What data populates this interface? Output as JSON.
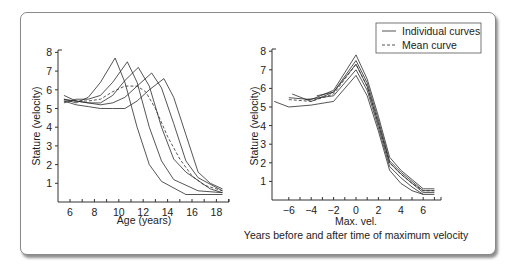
{
  "chart_data": [
    {
      "type": "line",
      "title": "",
      "xlabel": "Age (years)",
      "ylabel": "Stature (velocity)",
      "xlim": [
        5.3,
        19
      ],
      "ylim": [
        0,
        8
      ],
      "xticks": [
        6,
        8,
        10,
        12,
        14,
        16,
        18
      ],
      "xminor_ticks": [
        6,
        7,
        8,
        9,
        10,
        11,
        12,
        13,
        14,
        15,
        16,
        17,
        18,
        19
      ],
      "yticks": [
        1,
        2,
        3,
        4,
        5,
        6,
        7,
        8
      ],
      "grid": false,
      "series": [
        {
          "name": "Individual curve 1",
          "style": "solid",
          "x": [
            5.5,
            6.5,
            7.5,
            8.5,
            9.7,
            10.5,
            11.5,
            12.5,
            13.5,
            15.5,
            18.5
          ],
          "y": [
            5.5,
            5.3,
            5.6,
            6.4,
            7.7,
            6.4,
            4.0,
            2.0,
            1.1,
            0.4,
            0.4
          ]
        },
        {
          "name": "Individual curve 2",
          "style": "solid",
          "x": [
            5.5,
            6.5,
            7.5,
            8.5,
            9.5,
            10.7,
            11.5,
            12.5,
            13.5,
            14.5,
            16.5,
            18.5
          ],
          "y": [
            5.3,
            5.5,
            5.5,
            5.7,
            6.4,
            7.5,
            6.4,
            4.0,
            2.2,
            1.2,
            0.6,
            0.5
          ]
        },
        {
          "name": "Individual curve 3",
          "style": "solid",
          "x": [
            5.5,
            6.5,
            7.5,
            8.5,
            9.5,
            10.5,
            11.6,
            12.5,
            13.5,
            14.5,
            15.5,
            17.5,
            18.5
          ],
          "y": [
            5.5,
            5.4,
            5.3,
            5.3,
            5.7,
            6.5,
            7.2,
            6.2,
            4.0,
            2.3,
            1.6,
            0.7,
            0.5
          ]
        },
        {
          "name": "Individual curve 4",
          "style": "solid",
          "x": [
            5.5,
            6.5,
            7.5,
            8.5,
            9.5,
            10.5,
            11.5,
            12.7,
            13.5,
            14.5,
            15.5,
            16.5,
            18.5
          ],
          "y": [
            5.7,
            5.4,
            5.3,
            5.2,
            5.3,
            5.6,
            6.2,
            6.9,
            6.1,
            4.2,
            2.2,
            1.3,
            0.6
          ]
        },
        {
          "name": "Individual curve 5",
          "style": "solid",
          "x": [
            5.5,
            6.5,
            7.5,
            8.5,
            9.5,
            10.5,
            11.5,
            12.5,
            13.7,
            14.5,
            15.5,
            16.5,
            17.5,
            18.5
          ],
          "y": [
            5.4,
            5.2,
            5.1,
            5.0,
            5.0,
            5.0,
            5.4,
            6.0,
            6.6,
            5.6,
            3.6,
            1.6,
            1.0,
            0.7
          ]
        },
        {
          "name": "Mean curve",
          "style": "dashed",
          "x": [
            5.5,
            6.5,
            7.5,
            8.5,
            9.5,
            10.5,
            11.5,
            12.2,
            13.0,
            14.0,
            15.0,
            16.0,
            17.0,
            18.5
          ],
          "y": [
            5.4,
            5.4,
            5.4,
            5.5,
            5.9,
            6.2,
            6.2,
            5.9,
            5.0,
            3.5,
            2.3,
            1.4,
            0.9,
            0.6
          ]
        }
      ]
    },
    {
      "type": "line",
      "title": "",
      "xlabel": "Max. vel.",
      "xlabel2": "Years before and after time of maximum velocity",
      "ylabel": "Stature (velocity)",
      "xlim": [
        -7.4,
        7.6
      ],
      "ylim": [
        0,
        8
      ],
      "xticks": [
        -6,
        -4,
        -2,
        0,
        2,
        4,
        6
      ],
      "xtick_labels": [
        "−6",
        "−4",
        "−2",
        "0",
        "2",
        "4",
        "6"
      ],
      "xminor_ticks": [
        -6,
        -5,
        -4,
        -3,
        -2,
        -1,
        0,
        1,
        2,
        3,
        4,
        5,
        6,
        7
      ],
      "yticks": [
        1,
        2,
        3,
        4,
        5,
        6,
        7,
        8
      ],
      "grid": false,
      "legend": {
        "position": "upper right",
        "entries": [
          {
            "label": "Individual curves",
            "style": "solid"
          },
          {
            "label": "Mean curve",
            "style": "dashed"
          }
        ]
      },
      "series": [
        {
          "name": "Individual curve 1",
          "style": "solid",
          "x": [
            -6,
            -4,
            -2,
            0,
            1,
            2,
            3,
            4,
            5,
            6,
            7
          ],
          "y": [
            5.5,
            5.4,
            5.9,
            7.8,
            6.5,
            4.5,
            2.3,
            1.6,
            1.1,
            0.6,
            0.6
          ]
        },
        {
          "name": "Individual curve 2",
          "style": "solid",
          "x": [
            -5.7,
            -4,
            -2,
            0,
            1,
            2,
            3,
            4,
            5,
            6,
            7
          ],
          "y": [
            5.7,
            5.3,
            5.8,
            7.5,
            6.3,
            4.3,
            2.1,
            1.5,
            1.0,
            0.5,
            0.5
          ]
        },
        {
          "name": "Individual curve 3",
          "style": "solid",
          "x": [
            -3.5,
            -2,
            0,
            1,
            2,
            3,
            4,
            5,
            6,
            7
          ],
          "y": [
            5.6,
            5.8,
            7.3,
            6.1,
            4.1,
            2.0,
            1.4,
            0.9,
            0.4,
            0.4
          ]
        },
        {
          "name": "Individual curve 4",
          "style": "solid",
          "x": [
            -4.5,
            -2,
            0,
            1,
            2,
            3,
            4,
            5,
            6,
            7
          ],
          "y": [
            5.4,
            5.6,
            7.0,
            5.9,
            3.9,
            1.8,
            1.2,
            0.7,
            0.3,
            0.3
          ]
        },
        {
          "name": "Individual curve 5",
          "style": "solid",
          "x": [
            -7.3,
            -6,
            -4,
            -2,
            0,
            1,
            2,
            3,
            4,
            5,
            6
          ],
          "y": [
            5.3,
            5.0,
            5.1,
            5.3,
            6.7,
            5.6,
            3.7,
            1.6,
            0.9,
            0.5,
            0.3
          ]
        },
        {
          "name": "Mean curve",
          "style": "dashed",
          "x": [
            -6,
            -4,
            -2,
            0,
            1,
            2,
            3,
            4,
            5,
            6,
            7
          ],
          "y": [
            5.4,
            5.3,
            5.7,
            7.3,
            6.1,
            4.1,
            2.0,
            1.4,
            0.9,
            0.5,
            0.5
          ]
        }
      ]
    }
  ],
  "charts": {
    "left": {
      "xlabel": "Age (years)",
      "ylabel": "Stature (velocity)"
    },
    "right": {
      "xlabel": "Max. vel.",
      "xlabel2": "Years before and after time of maximum velocity",
      "ylabel": "Stature (velocity)"
    },
    "legend": {
      "individual": "Individual curves",
      "mean": "Mean curve"
    }
  },
  "colors": {
    "line": "#2a2a2a",
    "axis": "#333333",
    "border": "#8a8a8a",
    "background": "#ffffff"
  }
}
